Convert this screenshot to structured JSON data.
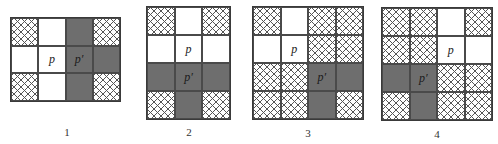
{
  "colors": {
    "gray": "#6e6e6e",
    "hatch_line": "#555555",
    "border": "#3a3a3a",
    "white": "#ffffff"
  },
  "legend_semantics": {
    "W": "white",
    "G": "gray",
    "H": "cross-hatched"
  },
  "panels": [
    {
      "caption": "1",
      "cols": 4,
      "rows": 3,
      "cells": [
        [
          "H",
          "W",
          "G",
          "H"
        ],
        [
          "W",
          "W",
          "G",
          "G"
        ],
        [
          "H",
          "W",
          "G",
          "H"
        ]
      ],
      "labels": [
        {
          "row": 1,
          "col": 1,
          "text": "p"
        },
        {
          "row": 1,
          "col": 2,
          "text": "p′"
        }
      ]
    },
    {
      "caption": "2",
      "cols": 3,
      "rows": 4,
      "cells": [
        [
          "H",
          "W",
          "H"
        ],
        [
          "W",
          "W",
          "W"
        ],
        [
          "G",
          "G",
          "G"
        ],
        [
          "H",
          "G",
          "H"
        ]
      ],
      "labels": [
        {
          "row": 1,
          "col": 1,
          "text": "p"
        },
        {
          "row": 2,
          "col": 1,
          "text": "p′"
        }
      ]
    },
    {
      "caption": "3",
      "cols": 4,
      "rows": 4,
      "cells": [
        [
          "H",
          "W",
          "H",
          "H"
        ],
        [
          "W",
          "W",
          "H",
          "H"
        ],
        [
          "H",
          "H",
          "G",
          "G"
        ],
        [
          "H",
          "H",
          "G",
          "H"
        ]
      ],
      "labels": [
        {
          "row": 1,
          "col": 1,
          "text": "p"
        },
        {
          "row": 2,
          "col": 2,
          "text": "p′"
        }
      ]
    },
    {
      "caption": "4",
      "cols": 4,
      "rows": 4,
      "cells": [
        [
          "H",
          "H",
          "W",
          "H"
        ],
        [
          "H",
          "H",
          "W",
          "W"
        ],
        [
          "G",
          "G",
          "H",
          "H"
        ],
        [
          "H",
          "G",
          "H",
          "H"
        ]
      ],
      "labels": [
        {
          "row": 1,
          "col": 2,
          "text": "p"
        },
        {
          "row": 2,
          "col": 1,
          "text": "p′"
        }
      ]
    }
  ]
}
